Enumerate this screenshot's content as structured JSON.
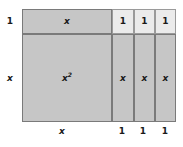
{
  "figure": {
    "type": "algebra-tile-area-model",
    "caption_expression": "x^2 + 3x + x + 3",
    "fill_colors": {
      "x_squared_tile": "#c6c6c6",
      "x_tile": "#c6c6c6",
      "unit_tile": "#ebebeb",
      "border": "#7a7a7a",
      "inner_border": "#9a9a9a",
      "background": "#ffffff"
    },
    "top_row": {
      "x_band_label": "x",
      "unit_labels": [
        "1",
        "1",
        "1"
      ]
    },
    "bottom_row": {
      "x_square_label": "x²",
      "x_column_labels": [
        "x",
        "x",
        "x"
      ]
    },
    "left_labels": {
      "top_band_height": "1",
      "main_row_height": "x"
    },
    "bottom_labels": {
      "x_square_width": "x",
      "unit_widths": [
        "1",
        "1",
        "1"
      ]
    }
  }
}
